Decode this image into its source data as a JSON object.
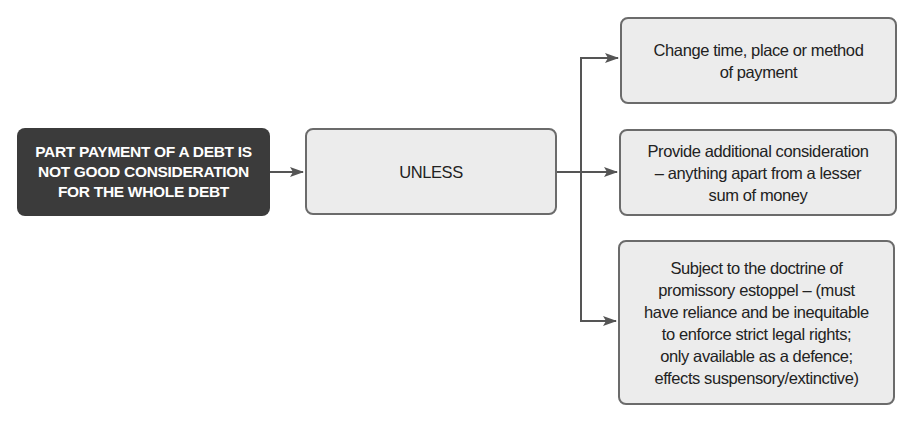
{
  "diagram": {
    "source_node": {
      "label": "PART PAYMENT OF A DEBT IS\nNOT GOOD CONSIDERATION\nFOR THE WHOLE DEBT",
      "fill": "#3b3b3b",
      "text_color": "#ffffff"
    },
    "middle_node": {
      "label": "UNLESS",
      "fill": "#ececec"
    },
    "outcomes": [
      {
        "label": "Change time, place or method\nof payment"
      },
      {
        "label": "Provide additional consideration\n– anything apart from a lesser\nsum of money"
      },
      {
        "label": "Subject to the doctrine of\npromissory estoppel – (must\nhave reliance and be inequitable\nto enforce strict legal rights;\nonly available as a defence;\neffects suspensory/extinctive)"
      }
    ],
    "edges": [
      {
        "from": "source_node",
        "to": "middle_node"
      },
      {
        "from": "middle_node",
        "to": "outcomes.0"
      },
      {
        "from": "middle_node",
        "to": "outcomes.1"
      },
      {
        "from": "middle_node",
        "to": "outcomes.2"
      }
    ],
    "colors": {
      "connector": "#555555",
      "box_border": "#6b6b6b"
    }
  }
}
